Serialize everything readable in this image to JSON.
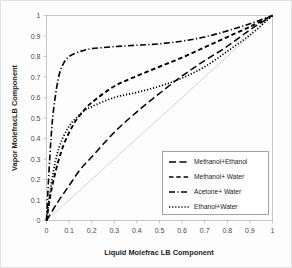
{
  "chart_data": {
    "type": "line",
    "title": "",
    "xlabel": "Liquid Molefrac LB Component",
    "ylabel": "Vapor MolefracLB Component",
    "xlim": [
      0,
      1
    ],
    "ylim": [
      0,
      1
    ],
    "xticks": [
      "0",
      "0.1",
      "0.2",
      "0.3",
      "0.4",
      "0.5",
      "0.6",
      "0.7",
      "0.8",
      "0.9",
      "1"
    ],
    "yticks": [
      "0",
      "0.1",
      "0.2",
      "0.3",
      "0.4",
      "0.5",
      "0.6",
      "0.7",
      "0.8",
      "0.9",
      "1"
    ],
    "grid": false,
    "legend_position": "lower-right",
    "reference_line": {
      "name": "y=x diagonal",
      "x": [
        0,
        1
      ],
      "y": [
        0,
        1
      ],
      "color": "#c9c9c9"
    },
    "series": [
      {
        "name": "Methanol+Ethanol",
        "dash": "long-dash",
        "color": "#000000",
        "x": [
          0,
          0.05,
          0.1,
          0.15,
          0.2,
          0.3,
          0.4,
          0.5,
          0.6,
          0.7,
          0.8,
          0.9,
          0.95,
          1
        ],
        "y": [
          0,
          0.09,
          0.17,
          0.25,
          0.31,
          0.43,
          0.53,
          0.62,
          0.705,
          0.78,
          0.85,
          0.93,
          0.965,
          1
        ]
      },
      {
        "name": "Methanol+ Water",
        "dash": "dash",
        "color": "#000000",
        "x": [
          0,
          0.02,
          0.05,
          0.08,
          0.12,
          0.16,
          0.2,
          0.3,
          0.4,
          0.5,
          0.6,
          0.7,
          0.8,
          0.9,
          1
        ],
        "y": [
          0,
          0.14,
          0.28,
          0.38,
          0.47,
          0.53,
          0.575,
          0.655,
          0.705,
          0.75,
          0.795,
          0.845,
          0.895,
          0.945,
          1
        ]
      },
      {
        "name": "Acetone+ Water",
        "dash": "dash-dot",
        "color": "#000000",
        "x": [
          0,
          0.01,
          0.02,
          0.03,
          0.05,
          0.07,
          0.1,
          0.15,
          0.2,
          0.3,
          0.4,
          0.5,
          0.6,
          0.7,
          0.8,
          0.9,
          1
        ],
        "y": [
          0,
          0.22,
          0.4,
          0.53,
          0.68,
          0.755,
          0.8,
          0.825,
          0.838,
          0.848,
          0.855,
          0.862,
          0.875,
          0.895,
          0.925,
          0.96,
          1
        ]
      },
      {
        "name": "Ethanol+Water",
        "dash": "dot",
        "color": "#000000",
        "x": [
          0,
          0.02,
          0.04,
          0.06,
          0.1,
          0.15,
          0.2,
          0.3,
          0.4,
          0.5,
          0.6,
          0.7,
          0.8,
          0.9,
          1
        ],
        "y": [
          0,
          0.17,
          0.29,
          0.37,
          0.46,
          0.52,
          0.555,
          0.6,
          0.625,
          0.655,
          0.695,
          0.75,
          0.825,
          0.905,
          1
        ]
      }
    ]
  },
  "legend": {
    "items": [
      {
        "label": "Methanol+Ethanol",
        "dash": "long-dash"
      },
      {
        "label": "Methanol+ Water",
        "dash": "dash"
      },
      {
        "label": "Acetone+ Water",
        "dash": "dash-dot"
      },
      {
        "label": "Ethanol+Water",
        "dash": "dot"
      }
    ]
  }
}
